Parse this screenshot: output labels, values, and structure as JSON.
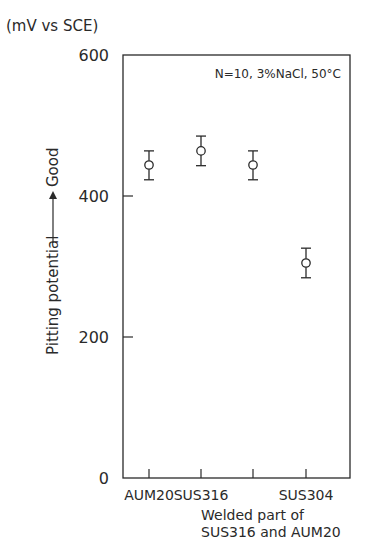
{
  "chart_data": {
    "type": "scatter",
    "title": "",
    "annotation": "N=10, 3%NaCl, 50°C",
    "unit_label": "(mV vs SCE)",
    "ylabel": "Pitting potential",
    "ylabel_arrow_text": "Good",
    "xlabel": "",
    "categories": [
      "AUM20",
      "SUS316",
      "Welded part of SUS316 and AUM20",
      "SUS304"
    ],
    "category_labels": [
      "AUM20",
      "SUS316",
      "",
      "SUS304"
    ],
    "category_sublabel_lines": [
      "Welded part of",
      "SUS316 and AUM20"
    ],
    "series": [
      {
        "name": "Pitting potential",
        "values": [
          444,
          464,
          444,
          305
        ],
        "error_upper": [
          464,
          485,
          464,
          326
        ],
        "error_lower": [
          423,
          443,
          423,
          284
        ],
        "marker": "open-circle"
      }
    ],
    "ylim": [
      0,
      600
    ],
    "yticks": [
      0,
      200,
      400,
      600
    ],
    "ytick_labels": [
      "0",
      "200",
      "400",
      "600"
    ],
    "grid": false,
    "legend": null
  }
}
